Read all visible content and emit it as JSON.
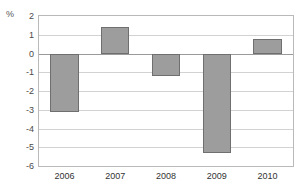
{
  "chart_data": {
    "type": "bar",
    "title": "",
    "xlabel": "",
    "ylabel": "%",
    "unit_label": "%",
    "categories": [
      "2006",
      "2007",
      "2008",
      "2009",
      "2010"
    ],
    "values": [
      -3.1,
      1.4,
      -1.2,
      -5.3,
      0.8
    ],
    "series": [
      {
        "name": "",
        "values": [
          -3.1,
          1.4,
          -1.2,
          -5.3,
          0.8
        ]
      }
    ],
    "ylim": [
      -6,
      2
    ],
    "yticks": [
      2,
      1,
      0,
      -1,
      -2,
      -3,
      -4,
      -5,
      -6
    ],
    "ytick_labels": [
      "2",
      "1",
      "0",
      "-1",
      "-2",
      "-3",
      "-4",
      "-5",
      "-6"
    ],
    "grid": true,
    "legend": "none",
    "colors": {
      "bar_fill": "#9d9d9d",
      "bar_border": "#6f6f6f",
      "gridline": "#d2d2d2",
      "zero_line": "#9a9a9a",
      "axis_border": "#b9b9b9",
      "tick_text": "#4a4a4a",
      "background": "#ffffff"
    }
  }
}
